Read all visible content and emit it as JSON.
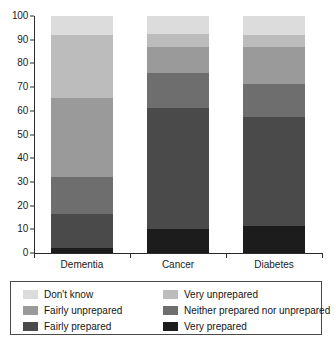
{
  "chart_data": {
    "type": "bar",
    "subtype": "stacked-100-vertical",
    "title": "",
    "subtitle": "",
    "xlabel": "",
    "ylabel": "",
    "categories": [
      "Dementia",
      "Cancer",
      "Diabetes"
    ],
    "ylim": [
      0,
      100
    ],
    "y_ticks": [
      0,
      10,
      20,
      30,
      40,
      50,
      60,
      70,
      80,
      90,
      100
    ],
    "y_tick_labels": [
      "0",
      "10",
      "20",
      "30",
      "40",
      "50",
      "60",
      "70",
      "80",
      "90",
      "100"
    ],
    "grid": false,
    "legend_position": "bottom",
    "stack_order": "bottom-to-top",
    "series": [
      {
        "name": "Very prepared",
        "color": "#1c1c1c",
        "values": [
          2.0,
          10.0,
          11.5
        ]
      },
      {
        "name": "Fairly prepared",
        "color": "#4a4a4a",
        "values": [
          14.5,
          51.0,
          46.0
        ]
      },
      {
        "name": "Neither prepared nor unprepared",
        "color": "#6e6e6e",
        "values": [
          15.5,
          15.0,
          14.0
        ]
      },
      {
        "name": "Fairly unprepared",
        "color": "#9a9a9a",
        "values": [
          33.5,
          11.0,
          15.5
        ]
      },
      {
        "name": "Very unprepared",
        "color": "#bcbcbc",
        "values": [
          26.5,
          5.5,
          5.0
        ]
      },
      {
        "name": "Don't know",
        "color": "#dcdcdc",
        "values": [
          8.0,
          7.5,
          8.0
        ]
      }
    ],
    "cumulative_boundaries": {
      "Dementia": [
        0,
        2.0,
        16.5,
        32.0,
        65.5,
        92.0,
        100
      ],
      "Cancer": [
        0,
        10.0,
        61.0,
        76.0,
        87.0,
        92.5,
        100
      ],
      "Diabetes": [
        0,
        11.5,
        57.5,
        71.5,
        87.0,
        92.0,
        100
      ]
    }
  },
  "legend": {
    "items": [
      {
        "label": "Don't know",
        "color": "#dcdcdc"
      },
      {
        "label": "Very unprepared",
        "color": "#bcbcbc"
      },
      {
        "label": "Fairly unprepared",
        "color": "#9a9a9a"
      },
      {
        "label": "Neither prepared nor unprepared",
        "color": "#6e6e6e"
      },
      {
        "label": "Fairly prepared",
        "color": "#4a4a4a"
      },
      {
        "label": "Very prepared",
        "color": "#1c1c1c"
      }
    ]
  },
  "axis": {
    "border_color": "#2b2b2b",
    "text_color": "#1a1a1a"
  }
}
